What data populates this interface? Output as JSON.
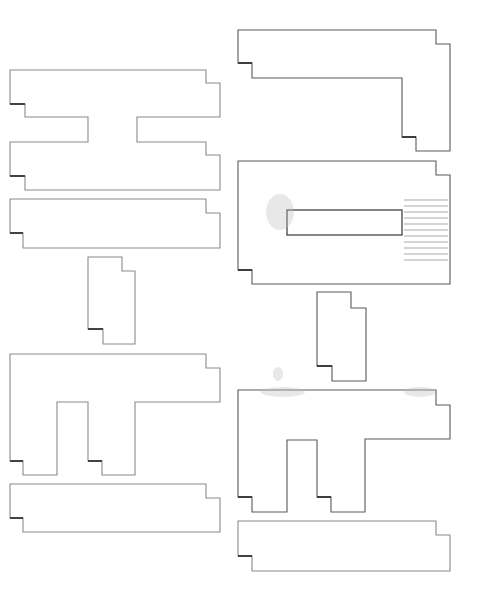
{
  "diagram": {
    "background": "#ffffff",
    "stroke_color": "#8a8a8a",
    "notch_color": "#222222",
    "shapes": [
      {
        "id": "left-h-shape",
        "kind": "h-shape",
        "points": "10,70 206,70 206,83 220,83 220,117 137,117 137,142 206,142 206,155 220,155 220,190 25,190 25,176 10,176 10,142 88,142 88,117 25,117 25,104 10,104",
        "notches": [
          "10,104 25,104",
          "10,176 25,176"
        ]
      },
      {
        "id": "left-long-bar",
        "kind": "bar",
        "points": "10,199 206,199 206,213 220,213 220,248 23,248 23,233 10,233",
        "notches": [
          "10,233 23,233"
        ]
      },
      {
        "id": "left-small-block",
        "kind": "block",
        "points": "88,257 122,257 122,271 135,271 135,344 103,344 103,329 88,329",
        "notches": [
          "88,329 103,329"
        ]
      },
      {
        "id": "left-pi-shape",
        "kind": "pi-shape",
        "points": "10,354 206,354 206,368 220,368 220,402 135,402 135,475 102,475 102,461 88,461 88,402 57,402 57,475 23,475 23,461 10,461",
        "notches": [
          "10,461 23,461",
          "88,461 102,461"
        ]
      },
      {
        "id": "left-bottom-bar",
        "kind": "bar",
        "points": "10,484 206,484 206,498 220,498 220,532 23,532 23,518 10,518",
        "notches": [
          "10,518 23,518"
        ]
      },
      {
        "id": "right-l-shape",
        "kind": "l-shape",
        "dark": true,
        "points": "238,30 436,30 436,44 450,44 450,151 416,151 416,137 402,137 402,78 252,78 252,63 238,63",
        "notches": [
          "238,63 252,63",
          "402,137 416,137"
        ]
      },
      {
        "id": "right-frame",
        "kind": "frame",
        "dark": true,
        "points": "238,161 436,161 436,175 450,175 450,284 252,284 252,270 238,270",
        "notches": [
          "238,270 252,270"
        ],
        "inner_rect": {
          "x": 287,
          "y": 210,
          "width": 115,
          "height": 25
        }
      },
      {
        "id": "right-small-block",
        "kind": "block",
        "dark": true,
        "points": "317,292 351,292 351,308 366,308 366,381 332,381 332,366 317,366",
        "notches": [
          "317,366 332,366"
        ]
      },
      {
        "id": "right-pi-shape",
        "kind": "pi-shape",
        "dark": true,
        "points": "238,390 436,390 436,405 450,405 450,439 365,439 365,512 331,512 331,497 317,497 317,440 287,440 287,512 252,512 252,497 238,497",
        "notches": [
          "238,497 252,497",
          "317,497 331,497"
        ]
      },
      {
        "id": "right-bottom-bar",
        "kind": "bar",
        "points": "238,521 436,521 436,535 450,535 450,571 252,571 252,556 238,556",
        "notches": [
          "238,556 252,556"
        ]
      }
    ]
  }
}
